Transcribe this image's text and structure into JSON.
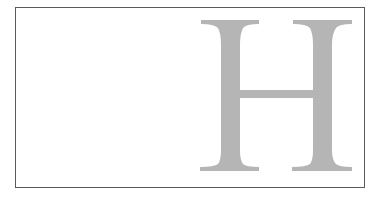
{
  "figure": {
    "letter": "H",
    "letter_color": "#b5b5b5",
    "border_color": "#5a5a5a",
    "background_color": "#ffffff"
  }
}
